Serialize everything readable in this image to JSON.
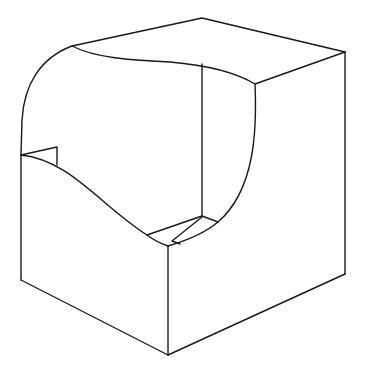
{
  "figure": {
    "stroke_color": "#1a1a1a",
    "background": "#ffffff"
  }
}
